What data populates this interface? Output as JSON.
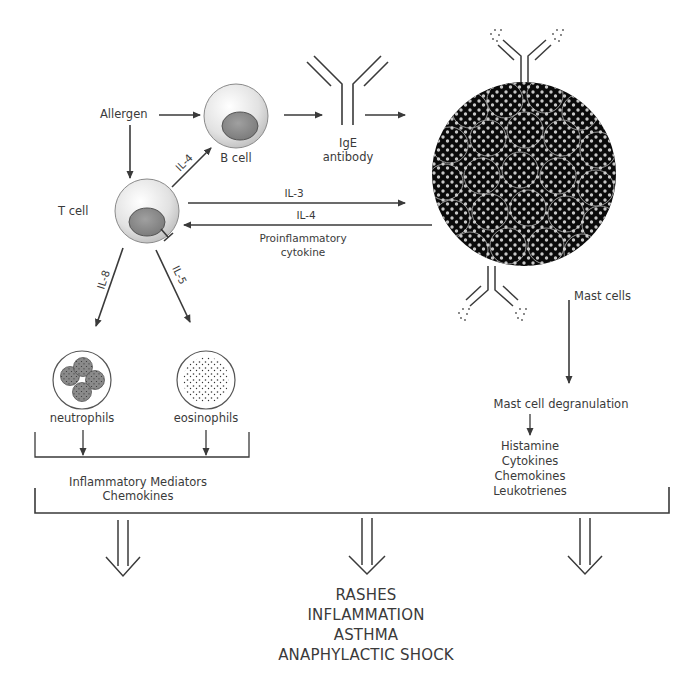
{
  "diagram": {
    "nodes": {
      "allergen": "Allergen",
      "b_cell": "B cell",
      "t_cell": "T cell",
      "ige": {
        "line1": "IgE",
        "line2": "antibody"
      },
      "mast_cells": "Mast cells",
      "neutrophils": "neutrophils",
      "eosinophils": "eosinophils",
      "mast_degranulation": "Mast cell degranulation"
    },
    "edges": {
      "il4_t_to_b": "IL-4",
      "il3": "IL-3",
      "il4_mast_to_t": "IL-4",
      "proinflammatory": {
        "line1": "Proinflammatory",
        "line2": "cytokine"
      },
      "il8": "IL-8",
      "il5": "IL-5"
    },
    "mediators_left": {
      "line1": "Inflammatory Mediators",
      "line2": "Chemokines"
    },
    "mediators_right": [
      "Histamine",
      "Cytokines",
      "Chemokines",
      "Leukotrienes"
    ],
    "outcomes": [
      "RASHES",
      "INFLAMMATION",
      "ASTHMA",
      "ANAPHYLACTIC SHOCK"
    ],
    "colors": {
      "line": "#3a3a3a",
      "cell_fill": "#e6e6e6",
      "nucleus": "#8c8c8c",
      "mast_fill": "#0a0a0a",
      "granule": "#d8d8d8"
    }
  }
}
